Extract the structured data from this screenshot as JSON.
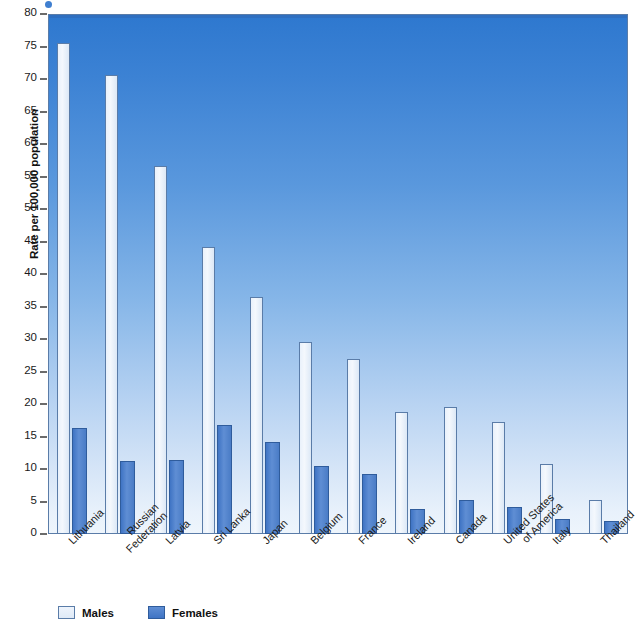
{
  "chart_data": {
    "type": "bar",
    "title": "",
    "xlabel": "",
    "ylabel": "Rate per 100,000 population",
    "ylim": [
      0,
      80
    ],
    "yticks": [
      0,
      5,
      10,
      15,
      20,
      25,
      30,
      35,
      40,
      45,
      50,
      55,
      60,
      65,
      70,
      75,
      80
    ],
    "grid": false,
    "legend_position": "bottom-left",
    "categories": [
      "Lithuania",
      "Russian\nFederation",
      "Latvia",
      "Sri Lanka",
      "Japan",
      "Belgium",
      "France",
      "Ireland",
      "Canada",
      "United States\nof America",
      "Italy",
      "Thailand"
    ],
    "series": [
      {
        "name": "Males",
        "color": "#eef4fc",
        "values": [
          75.6,
          70.6,
          56.6,
          44.1,
          36.5,
          29.5,
          27.0,
          18.7,
          19.6,
          17.3,
          10.7,
          5.3
        ]
      },
      {
        "name": "Females",
        "color": "#4a7cc6",
        "values": [
          16.3,
          11.2,
          11.4,
          16.7,
          14.2,
          10.5,
          9.2,
          3.9,
          5.3,
          4.1,
          2.3,
          2.0
        ]
      }
    ]
  },
  "legend": {
    "items": [
      {
        "label": "Males"
      },
      {
        "label": "Females"
      }
    ]
  },
  "colors": {
    "plot_top": "#2e78cf",
    "plot_bottom": "#eef5fc",
    "male_bar": "#eef4fc",
    "female_bar": "#4a7cc6",
    "axis": "#5a7ca8",
    "text": "#111111"
  }
}
